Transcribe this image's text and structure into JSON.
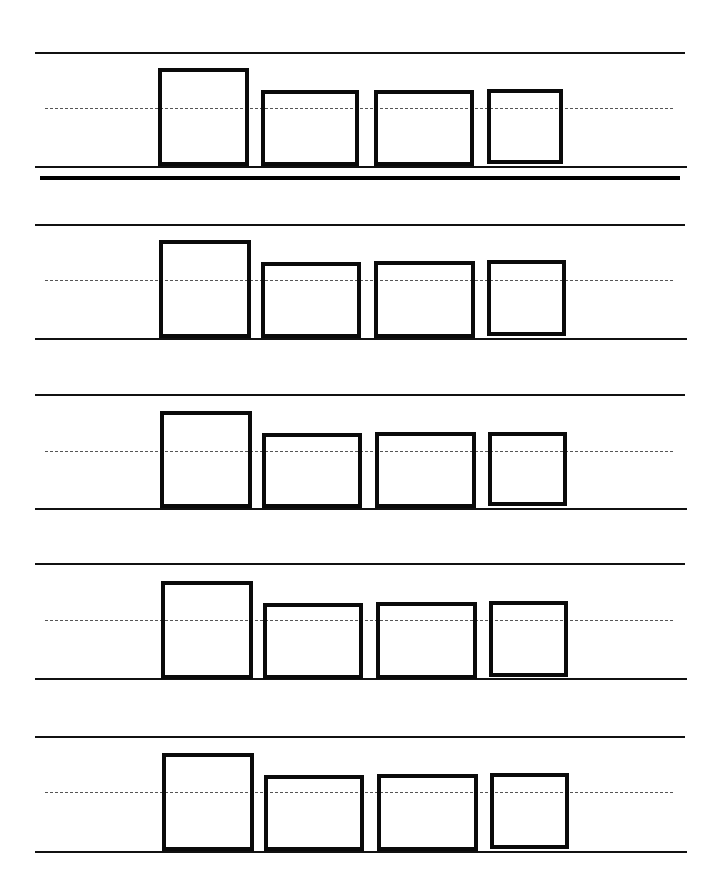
{
  "worksheet": {
    "type": "handwriting practice sheet",
    "line_color": "#111111",
    "midline_color": "#555555",
    "box_border_color": "#0a0a0a",
    "rows": [
      {
        "top": 52,
        "mid": 108,
        "base": 166,
        "separator": 176,
        "boxes": [
          {
            "x": 158,
            "y": 68,
            "w": 91,
            "h": 98
          },
          {
            "x": 261,
            "y": 90,
            "w": 98,
            "h": 76
          },
          {
            "x": 374,
            "y": 90,
            "w": 100,
            "h": 76
          },
          {
            "x": 487,
            "y": 89,
            "w": 76,
            "h": 75
          }
        ]
      },
      {
        "top": 224,
        "mid": 280,
        "base": 338,
        "separator": null,
        "boxes": [
          {
            "x": 159,
            "y": 240,
            "w": 92,
            "h": 98
          },
          {
            "x": 261,
            "y": 262,
            "w": 100,
            "h": 76
          },
          {
            "x": 374,
            "y": 261,
            "w": 101,
            "h": 77
          },
          {
            "x": 487,
            "y": 260,
            "w": 79,
            "h": 76
          }
        ]
      },
      {
        "top": 394,
        "mid": 451,
        "base": 508,
        "separator": null,
        "boxes": [
          {
            "x": 160,
            "y": 411,
            "w": 92,
            "h": 97
          },
          {
            "x": 262,
            "y": 433,
            "w": 100,
            "h": 75
          },
          {
            "x": 375,
            "y": 432,
            "w": 101,
            "h": 76
          },
          {
            "x": 488,
            "y": 432,
            "w": 79,
            "h": 74
          }
        ]
      },
      {
        "top": 563,
        "mid": 620,
        "base": 678,
        "separator": null,
        "boxes": [
          {
            "x": 161,
            "y": 581,
            "w": 92,
            "h": 98
          },
          {
            "x": 263,
            "y": 603,
            "w": 100,
            "h": 76
          },
          {
            "x": 376,
            "y": 602,
            "w": 101,
            "h": 77
          },
          {
            "x": 489,
            "y": 601,
            "w": 79,
            "h": 76
          }
        ]
      },
      {
        "top": 736,
        "mid": 792,
        "base": 851,
        "separator": null,
        "boxes": [
          {
            "x": 162,
            "y": 753,
            "w": 92,
            "h": 98
          },
          {
            "x": 264,
            "y": 775,
            "w": 100,
            "h": 76
          },
          {
            "x": 377,
            "y": 774,
            "w": 101,
            "h": 77
          },
          {
            "x": 490,
            "y": 773,
            "w": 79,
            "h": 76
          }
        ]
      }
    ]
  }
}
